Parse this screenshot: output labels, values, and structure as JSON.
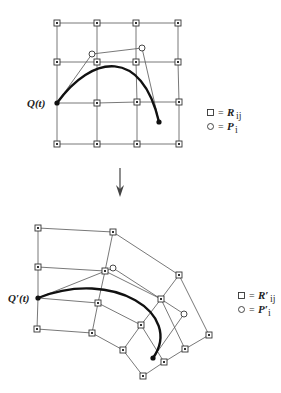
{
  "figure": {
    "top": {
      "curve_label": "Q(t)",
      "legend": [
        {
          "symbol": "square",
          "eq": "=",
          "label": "R",
          "subscript": "ij"
        },
        {
          "symbol": "circle",
          "eq": "=",
          "label": "P",
          "subscript": "i"
        }
      ],
      "grid_points": [
        [
          [
            57,
            23
          ],
          [
            97,
            23
          ],
          [
            136,
            23
          ],
          [
            178,
            23
          ]
        ],
        [
          [
            57,
            62
          ],
          [
            97,
            62
          ],
          [
            136,
            62
          ],
          [
            178,
            62
          ]
        ],
        [
          [
            57,
            103
          ],
          [
            97,
            103
          ],
          [
            137,
            102
          ],
          [
            179,
            102
          ]
        ],
        [
          [
            57,
            144
          ],
          [
            97,
            144
          ],
          [
            137,
            144
          ],
          [
            179,
            144
          ]
        ]
      ],
      "control_points": [
        [
          57,
          103
        ],
        [
          92,
          54
        ],
        [
          142,
          48
        ],
        [
          159,
          122
        ]
      ]
    },
    "arrow": {
      "direction": "down"
    },
    "bottom": {
      "curve_label": "Q′(t)",
      "legend": [
        {
          "symbol": "square",
          "eq": "=",
          "label": "R′",
          "subscript": "ij"
        },
        {
          "symbol": "circle",
          "eq": "=",
          "label": "P′",
          "subscript": "i"
        }
      ],
      "grid_points": [
        [
          [
            38,
            228
          ],
          [
            113,
            232
          ],
          [
            179,
            275
          ],
          [
            209,
            335
          ]
        ],
        [
          [
            38,
            267
          ],
          [
            105,
            271
          ],
          [
            161,
            299
          ],
          [
            185,
            349
          ]
        ],
        [
          [
            38,
            298
          ],
          [
            98,
            303
          ],
          [
            141,
            325
          ],
          [
            164,
            362
          ]
        ],
        [
          [
            37,
            329
          ],
          [
            92,
            333
          ],
          [
            123,
            350
          ],
          [
            143,
            376
          ]
        ]
      ],
      "control_points": [
        [
          38,
          298
        ],
        [
          113,
          268
        ],
        [
          184,
          314
        ],
        [
          153,
          358
        ]
      ]
    }
  }
}
